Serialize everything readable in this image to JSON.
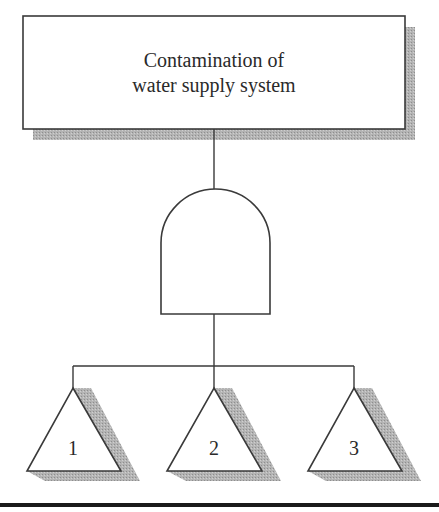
{
  "diagram": {
    "type": "fault-tree",
    "top_event": {
      "lines": [
        "Contamination of",
        "water supply system"
      ]
    },
    "gate": {
      "type": "AND",
      "icon": "and-gate-icon"
    },
    "basic_events": [
      {
        "label": "1",
        "icon": "transfer-triangle-icon"
      },
      {
        "label": "2",
        "icon": "transfer-triangle-icon"
      },
      {
        "label": "3",
        "icon": "transfer-triangle-icon"
      }
    ]
  },
  "colors": {
    "line": "#3a3a3a",
    "shadow": "#a8a8a8",
    "background": "#ffffff",
    "bottom_rule": "#1a1a1a"
  }
}
